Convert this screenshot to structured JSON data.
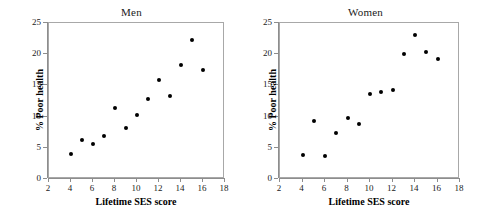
{
  "figure": {
    "xlabel": "Lifetime SES score",
    "ylabel": "% Poor health",
    "x_ticks": [
      2,
      4,
      6,
      8,
      10,
      12,
      14,
      16,
      18
    ],
    "y_ticks": [
      0,
      5,
      10,
      15,
      20,
      25
    ],
    "point_color": "#000000",
    "axis_color": "#8d8d8d"
  },
  "chart_data": [
    {
      "type": "scatter",
      "title": "Men",
      "xlabel": "Lifetime SES score",
      "ylabel": "% Poor health",
      "xlim": [
        2,
        18
      ],
      "ylim": [
        0,
        25
      ],
      "xticks": [
        2,
        4,
        6,
        8,
        10,
        12,
        14,
        16,
        18
      ],
      "yticks": [
        0,
        5,
        10,
        15,
        20,
        25
      ],
      "grid": false,
      "legend": null,
      "x": [
        4,
        5,
        6,
        7,
        8,
        9,
        10,
        11,
        12,
        13,
        14,
        15,
        16
      ],
      "y": [
        4.0,
        6.3,
        5.6,
        6.9,
        11.3,
        8.1,
        10.2,
        12.9,
        15.9,
        13.3,
        18.3,
        22.3,
        17.5
      ]
    },
    {
      "type": "scatter",
      "title": "Women",
      "xlabel": "Lifetime SES score",
      "ylabel": "% Poor health",
      "xlim": [
        2,
        18
      ],
      "ylim": [
        0,
        25
      ],
      "xticks": [
        2,
        4,
        6,
        8,
        10,
        12,
        14,
        16,
        18
      ],
      "yticks": [
        0,
        5,
        10,
        15,
        20,
        25
      ],
      "grid": false,
      "legend": null,
      "x": [
        4,
        5,
        6,
        7,
        8,
        9,
        10,
        11,
        12,
        13,
        14,
        15,
        16
      ],
      "y": [
        3.8,
        9.3,
        3.7,
        7.4,
        9.7,
        8.8,
        13.7,
        14.0,
        14.3,
        20.0,
        23.1,
        20.3,
        19.3
      ]
    }
  ]
}
